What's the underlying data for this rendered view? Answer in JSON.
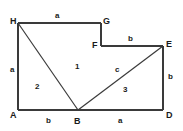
{
  "figure": {
    "canvas": {
      "width": 183,
      "height": 131
    },
    "stroke_color": "#3a3a3a",
    "label_color": "#1a1a1a",
    "background_color": "#ffffff",
    "vertices": [
      {
        "id": "H",
        "label": "H",
        "x": 18,
        "y": 23,
        "label_x": 10,
        "label_y": 17
      },
      {
        "id": "G",
        "label": "G",
        "x": 101,
        "y": 23,
        "label_x": 103,
        "label_y": 17
      },
      {
        "id": "F",
        "label": "F",
        "x": 101,
        "y": 46,
        "label_x": 92,
        "label_y": 41
      },
      {
        "id": "E",
        "label": "E",
        "x": 163,
        "y": 46,
        "label_x": 166,
        "label_y": 40
      },
      {
        "id": "D",
        "label": "D",
        "x": 163,
        "y": 110,
        "label_x": 166,
        "label_y": 111
      },
      {
        "id": "B",
        "label": "B",
        "x": 78,
        "y": 110,
        "label_x": 74,
        "label_y": 117
      },
      {
        "id": "A",
        "label": "A",
        "x": 18,
        "y": 110,
        "label_x": 10,
        "label_y": 111
      }
    ],
    "edges": [
      {
        "id": "HG",
        "from": "H",
        "to": "G",
        "length_label": "a",
        "label_x": 55,
        "label_y": 12
      },
      {
        "id": "GF",
        "from": "G",
        "to": "F",
        "length_label": "",
        "label_x": 0,
        "label_y": 0
      },
      {
        "id": "FE",
        "from": "F",
        "to": "E",
        "length_label": "b",
        "label_x": 128,
        "label_y": 35
      },
      {
        "id": "ED",
        "from": "E",
        "to": "D",
        "length_label": "b",
        "label_x": 168,
        "label_y": 73
      },
      {
        "id": "DB",
        "from": "D",
        "to": "B",
        "length_label": "a",
        "label_x": 118,
        "label_y": 117
      },
      {
        "id": "BA",
        "from": "B",
        "to": "A",
        "length_label": "b",
        "label_x": 46,
        "label_y": 117
      },
      {
        "id": "AH",
        "from": "A",
        "to": "H",
        "length_label": "a",
        "label_x": 10,
        "label_y": 66
      }
    ],
    "diagonals": [
      {
        "id": "HB",
        "from": "H",
        "to": "B",
        "length_label": "",
        "label_x": 0,
        "label_y": 0
      },
      {
        "id": "BE",
        "from": "B",
        "to": "E",
        "length_label": "c",
        "label_x": 115,
        "label_y": 66
      }
    ],
    "regions": [
      {
        "id": "region-1",
        "label": "1",
        "label_x": 75,
        "label_y": 63
      },
      {
        "id": "region-2",
        "label": "2",
        "label_x": 35,
        "label_y": 83
      },
      {
        "id": "region-3",
        "label": "3",
        "label_x": 123,
        "label_y": 86
      }
    ]
  }
}
